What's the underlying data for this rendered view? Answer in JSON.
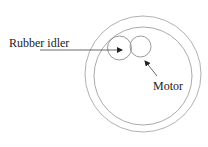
{
  "diagram": {
    "labels": {
      "idler": "Rubber idler",
      "motor": "Motor"
    },
    "colors": {
      "stroke": "#9a9a9a",
      "arrow": "#333333",
      "text": "#222222",
      "background": "#ffffff"
    },
    "components": [
      {
        "name": "outer-rim",
        "shape": "circle"
      },
      {
        "name": "inner-rim",
        "shape": "circle"
      },
      {
        "name": "rubber-idler",
        "shape": "circle"
      },
      {
        "name": "motor-pulley",
        "shape": "circle"
      }
    ]
  }
}
